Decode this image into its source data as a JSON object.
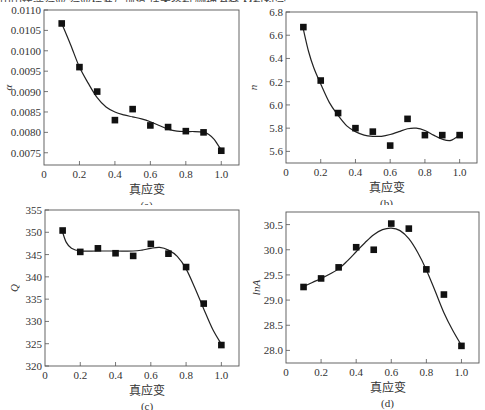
{
  "top_text": "中国铸造行业 行业标准与规范 技术资料 物理冶金 材料科学",
  "chart_data": [
    {
      "type": "scatter",
      "panel": "(a)",
      "title": "",
      "xlabel": "真应变",
      "ylabel": "α",
      "xlim": [
        0,
        1.1
      ],
      "ylim": [
        0.0072,
        0.011
      ],
      "xticks": [
        0,
        0.2,
        0.4,
        0.6,
        0.8,
        1.0
      ],
      "xtick_labels": [
        "0",
        "0.2",
        "0.4",
        "0.6",
        "0.8",
        "1.0"
      ],
      "yticks": [
        0.0075,
        0.008,
        0.0085,
        0.009,
        0.0095,
        0.01,
        0.0105,
        0.011
      ],
      "ytick_labels": [
        "0.0075",
        "0.0080",
        "0.0085",
        "0.0090",
        "0.0095",
        "0.0100",
        "0.0105",
        "0.0110"
      ],
      "x": [
        0.1,
        0.2,
        0.3,
        0.4,
        0.5,
        0.6,
        0.7,
        0.8,
        0.9,
        1.0
      ],
      "y": [
        0.01067,
        0.0096,
        0.009,
        0.0083,
        0.00857,
        0.00817,
        0.00813,
        0.00803,
        0.008,
        0.00755
      ],
      "fit_x": [
        0.1,
        0.15,
        0.2,
        0.25,
        0.3,
        0.35,
        0.4,
        0.45,
        0.5,
        0.55,
        0.6,
        0.65,
        0.7,
        0.75,
        0.8,
        0.85,
        0.9,
        0.93,
        0.96,
        0.98,
        1.0
      ],
      "fit_y": [
        0.01067,
        0.01015,
        0.0096,
        0.0092,
        0.00885,
        0.00862,
        0.0085,
        0.00843,
        0.00838,
        0.00833,
        0.00826,
        0.00817,
        0.00808,
        0.00803,
        0.00802,
        0.00802,
        0.008,
        0.00795,
        0.00783,
        0.0077,
        0.00757
      ],
      "grid": false,
      "legend": null
    },
    {
      "type": "scatter",
      "panel": "(b)",
      "title": "",
      "xlabel": "真应变",
      "ylabel": "n",
      "xlim": [
        0,
        1.1
      ],
      "ylim": [
        5.5,
        6.8
      ],
      "xticks": [
        0,
        0.2,
        0.4,
        0.6,
        0.8,
        1.0
      ],
      "xtick_labels": [
        "0",
        "0.2",
        "0.4",
        "0.6",
        "0.8",
        "1.0"
      ],
      "yticks": [
        5.6,
        5.8,
        6.0,
        6.2,
        6.4,
        6.6,
        6.8
      ],
      "ytick_labels": [
        "5.6",
        "5.8",
        "6.0",
        "6.2",
        "6.4",
        "6.6",
        "6.8"
      ],
      "x": [
        0.1,
        0.2,
        0.3,
        0.4,
        0.5,
        0.6,
        0.7,
        0.8,
        0.9,
        1.0
      ],
      "y": [
        6.67,
        6.21,
        5.93,
        5.8,
        5.77,
        5.65,
        5.88,
        5.74,
        5.74,
        5.74
      ],
      "fit_x": [
        0.1,
        0.13,
        0.16,
        0.2,
        0.25,
        0.3,
        0.35,
        0.4,
        0.45,
        0.5,
        0.55,
        0.6,
        0.65,
        0.7,
        0.75,
        0.8,
        0.85,
        0.9,
        0.95,
        1.0
      ],
      "fit_y": [
        6.65,
        6.46,
        6.32,
        6.18,
        6.02,
        5.91,
        5.82,
        5.77,
        5.74,
        5.73,
        5.73,
        5.745,
        5.77,
        5.795,
        5.8,
        5.78,
        5.74,
        5.705,
        5.695,
        5.74
      ],
      "grid": false,
      "legend": null
    },
    {
      "type": "scatter",
      "panel": "(c)",
      "title": "",
      "xlabel": "真应变",
      "ylabel": "Q",
      "xlim": [
        0,
        1.1
      ],
      "ylim": [
        320,
        355
      ],
      "xticks": [
        0,
        0.2,
        0.4,
        0.6,
        0.8,
        1.0
      ],
      "xtick_labels": [
        "0",
        "0.2",
        "0.4",
        "0.6",
        "0.8",
        "1.0"
      ],
      "yticks": [
        320,
        325,
        330,
        335,
        340,
        345,
        350,
        355
      ],
      "ytick_labels": [
        "320",
        "325",
        "330",
        "335",
        "340",
        "345",
        "350",
        "355"
      ],
      "x": [
        0.1,
        0.2,
        0.3,
        0.4,
        0.5,
        0.6,
        0.7,
        0.8,
        0.9,
        1.0
      ],
      "y": [
        350.4,
        345.6,
        346.4,
        345.3,
        344.7,
        347.4,
        345.2,
        342.2,
        334.0,
        324.7
      ],
      "fit_x": [
        0.1,
        0.12,
        0.15,
        0.2,
        0.3,
        0.4,
        0.5,
        0.55,
        0.6,
        0.65,
        0.7,
        0.75,
        0.8,
        0.85,
        0.9,
        0.95,
        1.0
      ],
      "fit_y": [
        350.0,
        347.8,
        346.4,
        345.8,
        345.8,
        345.8,
        345.8,
        346.0,
        346.4,
        346.6,
        346.0,
        344.6,
        341.8,
        337.5,
        332.8,
        328.3,
        324.9
      ],
      "grid": false,
      "legend": null
    },
    {
      "type": "scatter",
      "panel": "(d)",
      "title": "",
      "xlabel": "真应变",
      "ylabel": "lnA",
      "xlim": [
        0,
        1.1
      ],
      "ylim": [
        27.75,
        30.75
      ],
      "xticks": [
        0,
        0.2,
        0.4,
        0.6,
        0.8,
        1.0
      ],
      "xtick_labels": [
        "0",
        "0.2",
        "0.4",
        "0.6",
        "0.8",
        "1.0"
      ],
      "yticks": [
        28.0,
        28.5,
        29.0,
        29.5,
        30.0,
        30.5
      ],
      "ytick_labels": [
        "28.0",
        "28.5",
        "29.0",
        "29.5",
        "30.0",
        "30.5"
      ],
      "x": [
        0.1,
        0.2,
        0.3,
        0.4,
        0.5,
        0.6,
        0.7,
        0.8,
        0.9,
        1.0
      ],
      "y": [
        29.26,
        29.43,
        29.65,
        30.05,
        30.0,
        30.52,
        30.42,
        29.61,
        29.11,
        28.09
      ],
      "fit_x": [
        0.1,
        0.15,
        0.2,
        0.25,
        0.3,
        0.35,
        0.4,
        0.45,
        0.5,
        0.55,
        0.6,
        0.65,
        0.7,
        0.75,
        0.8,
        0.85,
        0.9,
        0.95,
        1.0
      ],
      "fit_y": [
        29.27,
        29.35,
        29.43,
        29.52,
        29.62,
        29.78,
        29.96,
        30.14,
        30.3,
        30.4,
        30.43,
        30.38,
        30.22,
        29.95,
        29.6,
        29.18,
        28.75,
        28.4,
        28.1
      ],
      "grid": false,
      "legend": null
    }
  ]
}
